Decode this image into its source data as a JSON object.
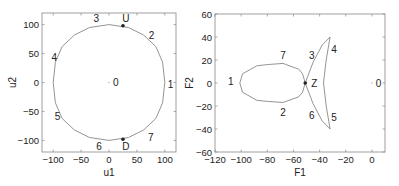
{
  "chart_data": [
    {
      "type": "line",
      "title": "",
      "xlabel": "u1",
      "ylabel": "u2",
      "xlim": [
        -120,
        120
      ],
      "ylim": [
        -120,
        120
      ],
      "xticks": [
        "-100",
        "-50",
        "0",
        "50",
        "100"
      ],
      "yticks": [
        "100",
        "50",
        "0",
        "-50",
        "-100"
      ],
      "grid": false,
      "series": [
        {
          "name": "control boundary",
          "x": [
            100,
            96,
            84,
            62,
            35,
            0,
            -35,
            -62,
            -84,
            -96,
            -100,
            -96,
            -84,
            -62,
            -35,
            0,
            35,
            62,
            84,
            96,
            100
          ],
          "y": [
            0,
            35,
            62,
            82,
            95,
            100,
            95,
            82,
            62,
            35,
            0,
            -35,
            -62,
            -82,
            -95,
            -100,
            -95,
            -82,
            -62,
            -35,
            0
          ]
        }
      ],
      "points": [
        {
          "label": "U",
          "x": 25,
          "y": 98,
          "marker": "dot"
        },
        {
          "label": "D",
          "x": 25,
          "y": -98,
          "marker": "dot"
        }
      ],
      "annotations": [
        {
          "text": "0",
          "x": 12,
          "y": 0
        },
        {
          "text": "1",
          "x": 110,
          "y": -3
        },
        {
          "text": "2",
          "x": 76,
          "y": 82
        },
        {
          "text": "3",
          "x": -23,
          "y": 110
        },
        {
          "text": "4",
          "x": -98,
          "y": 44
        },
        {
          "text": "5",
          "x": -92,
          "y": -58
        },
        {
          "text": "6",
          "x": -18,
          "y": -110
        },
        {
          "text": "7",
          "x": 75,
          "y": -95
        },
        {
          "text": "U",
          "x": 30,
          "y": 110
        },
        {
          "text": "D",
          "x": 30,
          "y": -111
        }
      ]
    },
    {
      "type": "line",
      "title": "",
      "xlabel": "F1",
      "ylabel": "F2",
      "xlim": [
        -120,
        10
      ],
      "ylim": [
        -60,
        60
      ],
      "xticks": [
        "-120",
        "-100",
        "-80",
        "-60",
        "-40",
        "-20",
        "0"
      ],
      "yticks": [
        "60",
        "40",
        "20",
        "0",
        "-20",
        "-40",
        "-60"
      ],
      "grid": false,
      "series": [
        {
          "name": "force boundary",
          "x": [
            -51,
            -53,
            -56,
            -68,
            -80,
            -88,
            -99,
            -101,
            -99,
            -88,
            -80,
            -68,
            -56,
            -53,
            -51,
            -45,
            -38,
            -32,
            -35,
            -37,
            -35,
            -32,
            -38,
            -45,
            -51
          ],
          "y": [
            0,
            8,
            12,
            17,
            16,
            15,
            8,
            0,
            -8,
            -15,
            -16,
            -17,
            -12,
            -8,
            0,
            18,
            33,
            40,
            20,
            0,
            -20,
            -40,
            -33,
            -18,
            0
          ]
        }
      ],
      "points": [
        {
          "label": "Z",
          "x": -51,
          "y": 0,
          "marker": "dot"
        }
      ],
      "annotations": [
        {
          "text": "0",
          "x": 5,
          "y": 0
        },
        {
          "text": "1",
          "x": -108,
          "y": 1
        },
        {
          "text": "2",
          "x": -68,
          "y": -26
        },
        {
          "text": "3",
          "x": -46,
          "y": 24
        },
        {
          "text": "4",
          "x": -29,
          "y": 29
        },
        {
          "text": "5",
          "x": -29,
          "y": -30
        },
        {
          "text": "6",
          "x": -46,
          "y": -28
        },
        {
          "text": "7",
          "x": -68,
          "y": 24
        },
        {
          "text": "Z",
          "x": -44,
          "y": 0
        }
      ]
    }
  ],
  "colors": {
    "axis": "#888888",
    "curve": "#888888",
    "marker": "#222222",
    "text": "#222222"
  }
}
